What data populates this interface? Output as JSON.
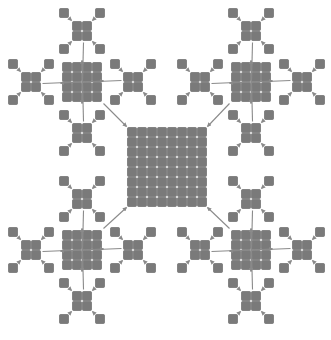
{
  "diagram": {
    "title": "",
    "colors": {
      "cell_fill": "#7a7a7a",
      "cell_stroke": "#5e5e5e",
      "arrow": "#8a8a8a",
      "background": "#ffffff"
    },
    "levels": [
      {
        "name": "single",
        "grid": 1,
        "count": 64
      },
      {
        "name": "2x2 block",
        "grid": 2,
        "count": 16
      },
      {
        "name": "4x4 block",
        "grid": 4,
        "count": 4
      },
      {
        "name": "8x8 block",
        "grid": 8,
        "count": 1
      }
    ],
    "center": {
      "x": 167,
      "y": 167,
      "grid": 8,
      "size": 80
    },
    "quadrants": [
      {
        "name": "top-left",
        "x": 82,
        "y": 82
      },
      {
        "name": "top-right",
        "x": 251,
        "y": 82
      },
      {
        "name": "bottom-left",
        "x": 82,
        "y": 250
      },
      {
        "name": "bottom-right",
        "x": 251,
        "y": 250
      }
    ],
    "caption": " "
  }
}
